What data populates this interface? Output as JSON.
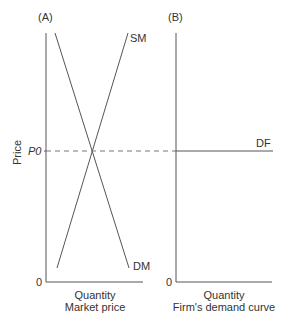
{
  "panels": {
    "a": {
      "label": "(A)",
      "y_axis_label": "Price",
      "price_label": "P0",
      "origin_label": "0",
      "x_axis_label": "Quantity",
      "caption": "Market price",
      "supply_label": "SM",
      "demand_label": "DM"
    },
    "b": {
      "label": "(B)",
      "origin_label": "0",
      "x_axis_label": "Quantity",
      "caption": "Firm's demand curve",
      "demand_label": "DF"
    }
  },
  "colors": {
    "line": "#555555",
    "dashed": "#777777",
    "text": "#333333"
  }
}
